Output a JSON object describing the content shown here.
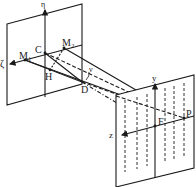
{
  "diagram": {
    "type": "optical geometry / interference diagram",
    "panels": [
      {
        "name": "source-plane",
        "axes": [
          "ζ",
          "η"
        ]
      },
      {
        "name": "observation-screen",
        "axes": [
          "z",
          "y"
        ]
      }
    ],
    "labels": {
      "eta": "η",
      "zeta": "ζ",
      "M1": "M₁",
      "M2": "M₂",
      "C": "C",
      "H": "H",
      "D": "D",
      "nu": "ν",
      "y": "y",
      "z": "z",
      "F": "F",
      "P": "P"
    },
    "colors": {
      "stroke": "#1a1a1a",
      "background": "#ffffff"
    }
  }
}
